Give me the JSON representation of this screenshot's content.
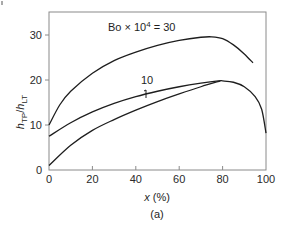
{
  "chart_data": {
    "type": "line",
    "title": "",
    "xlabel": "x (%)",
    "ylabel": "h_TP/h_LT",
    "panel_label": "(a)",
    "xlim": [
      0,
      100
    ],
    "ylim": [
      0,
      35
    ],
    "xticks": [
      0,
      20,
      40,
      60,
      80,
      100
    ],
    "yticks": [
      0,
      10,
      20,
      30
    ],
    "grid": false,
    "series": [
      {
        "name": "Bo × 10^4 = 30",
        "label": "Bo × 10⁴ = 30",
        "x": [
          0,
          5,
          10,
          20,
          30,
          40,
          50,
          60,
          70,
          75,
          80,
          85,
          90,
          94
        ],
        "y": [
          10,
          14.5,
          17.5,
          21.5,
          24.3,
          26.2,
          27.7,
          28.8,
          29.5,
          29.6,
          29.2,
          27.8,
          25.8,
          23.8
        ]
      },
      {
        "name": "Bo × 10^4 = 10",
        "label": "10",
        "x": [
          0,
          10,
          20,
          30,
          40,
          50,
          60,
          70,
          78,
          80,
          85,
          90,
          95,
          98,
          100
        ],
        "y": [
          7.5,
          10.5,
          12.9,
          14.8,
          16.3,
          17.5,
          18.5,
          19.3,
          19.8,
          19.8,
          19.5,
          18.5,
          16.3,
          13.5,
          8.2
        ]
      },
      {
        "name": "Bo × 10^4 = 10 (lower bound)",
        "label": "",
        "x": [
          0,
          10,
          20,
          30,
          40,
          50,
          60,
          70,
          79
        ],
        "y": [
          1,
          5.5,
          8.8,
          11.2,
          13.3,
          15.2,
          16.9,
          18.5,
          19.8
        ]
      }
    ],
    "annotations": [
      {
        "text": "Bo × 10⁴ = 30",
        "x": 32,
        "y": 30.5
      },
      {
        "text": "10",
        "x": 44,
        "y": 19.3
      },
      {
        "text": "range-marker",
        "x": 43,
        "y_from": 16.3,
        "y_to": 14.2
      }
    ],
    "legend": "none"
  },
  "labels": {
    "bo_prefix": "Bo × 10",
    "bo_exp": "4",
    "bo_suffix": " = 30",
    "y_h1": "h",
    "y_sub1": "TP",
    "y_slash": "/",
    "y_h2": "h",
    "y_sub2": "LT",
    "x_label": "x",
    "x_unit": " (%)",
    "panel": "(a)",
    "curve10": "10"
  }
}
